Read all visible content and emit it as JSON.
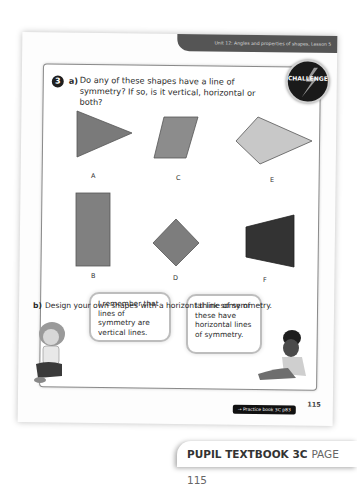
{
  "header": {
    "unit_banner": "Unit 12: Angles and properties of shapes, Lesson 5"
  },
  "question": {
    "number": "3",
    "part_a_label": "a)",
    "part_a_text": "Do any of these shapes have a line of symmetry? If so, is it vertical, horizontal or both?",
    "badge": "CHALLENGE",
    "part_b_label": "b)",
    "part_b_text": "Design your own shapes with a horizontal line of symmetry."
  },
  "shapes": [
    {
      "label": "A",
      "type": "triangle",
      "color": "#7a7a7a"
    },
    {
      "label": "C",
      "type": "parallelogram",
      "color": "#8c8c8c"
    },
    {
      "label": "E",
      "type": "pentagon",
      "color": "#c8c8c8"
    },
    {
      "label": "B",
      "type": "rectangle",
      "color": "#808080"
    },
    {
      "label": "D",
      "type": "square-rotated",
      "color": "#7d7d7d"
    },
    {
      "label": "F",
      "type": "trapezium",
      "color": "#333333"
    }
  ],
  "speech": {
    "left": "I remember that lines of symmetry are vertical lines.",
    "right": "I think some of these have horizontal lines of symmetry."
  },
  "footer": {
    "page_number": "115",
    "practice_link": "→ Practice book 3C p83",
    "book_title": "PUPIL TEXTBOOK 3C",
    "book_page": "PAGE 115"
  }
}
